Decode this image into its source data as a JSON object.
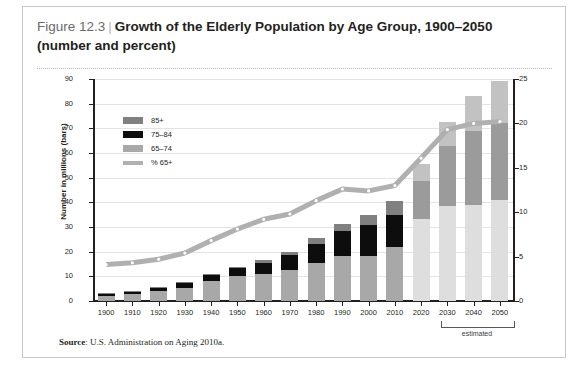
{
  "figure": {
    "number": "Figure 12.3",
    "separator": "|",
    "title_line1": "Growth of the Elderly Population by Age Group, 1900–2050",
    "title_line2": "(number and percent)",
    "source_label": "Source",
    "source_text": ": U.S. Administration on Aging 2010a.",
    "estimated_label": "estimated"
  },
  "colors": {
    "age_85plus": "#808080",
    "age_75_84": "#0d0d0d",
    "age_65_74": "#a8a8a8",
    "pct_line": "#b0b0b0",
    "age_85plus_proj": "#c2c2c2",
    "age_75_84_proj": "#9b9b9b",
    "age_65_74_proj": "#dedede",
    "axis": "#231f20",
    "grid": "#e3e3e3"
  },
  "legend": {
    "items": [
      {
        "label": "85+",
        "swatch": "age_85plus",
        "type": "swatch"
      },
      {
        "label": "75–84",
        "swatch": "age_75_84",
        "type": "swatch"
      },
      {
        "label": "65–74",
        "swatch": "age_65_74",
        "type": "swatch"
      },
      {
        "label": "% 65+",
        "swatch": "pct_line",
        "type": "line"
      }
    ]
  },
  "chart_data": {
    "type": "bar",
    "title": "Growth of the Elderly Population by Age Group, 1900–2050 (number and percent)",
    "xlabel": "",
    "ylabel": "Number in millions (bars)",
    "ylabel_right": "Percentage 65 and older",
    "ylim": [
      0,
      90
    ],
    "ylim_right": [
      0,
      25
    ],
    "yticks": [
      0,
      10,
      20,
      30,
      40,
      50,
      60,
      70,
      80,
      90
    ],
    "yticks_right": [
      0,
      5,
      10,
      15,
      20,
      25
    ],
    "grid": true,
    "legend_position": "upper-left-inside",
    "stacked": true,
    "categories": [
      "1900",
      "1910",
      "1920",
      "1930",
      "1940",
      "1950",
      "1960",
      "1970",
      "1980",
      "1990",
      "2000",
      "2010",
      "2020",
      "2030",
      "2040",
      "2050"
    ],
    "projected_from": "2020",
    "series": [
      {
        "name": "65–74",
        "values": [
          2.2,
          3.0,
          4.0,
          5.4,
          8.0,
          10.0,
          11.0,
          12.5,
          15.6,
          18.1,
          18.4,
          21.7,
          33.4,
          38.6,
          38.8,
          41.1
        ]
      },
      {
        "name": "75–84",
        "values": [
          0.8,
          1.0,
          1.4,
          2.0,
          2.6,
          3.3,
          4.6,
          6.1,
          7.7,
          10.1,
          12.4,
          13.0,
          15.4,
          24.4,
          30.0,
          30.9
        ]
      },
      {
        "name": "85+",
        "values": [
          0.1,
          0.2,
          0.2,
          0.3,
          0.4,
          0.6,
          0.9,
          1.4,
          2.2,
          3.1,
          4.2,
          5.8,
          6.6,
          9.6,
          14.2,
          17.0
        ]
      }
    ],
    "line_series": {
      "name": "% 65+",
      "axis": "right",
      "values": [
        4.1,
        4.3,
        4.7,
        5.4,
        6.8,
        8.1,
        9.2,
        9.8,
        11.3,
        12.6,
        12.4,
        13.0,
        16.1,
        19.3,
        20.0,
        20.2
      ]
    }
  }
}
